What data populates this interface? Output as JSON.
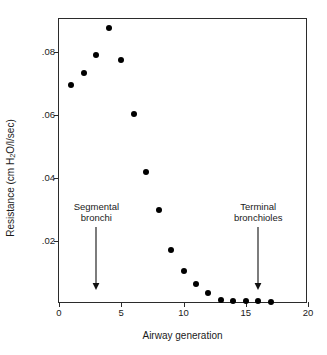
{
  "chart_data": {
    "type": "scatter",
    "title": "",
    "xlabel": "Airway generation",
    "ylabel": "Resistance (cm H2O/l/sec)",
    "ylabel_parts": {
      "before": "Resistance (cm H",
      "sub": "2",
      "after": "O/l/sec)"
    },
    "xlim": [
      0,
      20
    ],
    "ylim": [
      0,
      0.0905
    ],
    "grid": false,
    "legend": null,
    "xticks": [
      0,
      5,
      10,
      15,
      20
    ],
    "xtick_labels": [
      "0",
      "5",
      "10",
      "15",
      "20"
    ],
    "yticks": [
      0.02,
      0.04,
      0.06,
      0.08
    ],
    "ytick_labels": [
      ".02",
      ".04",
      ".06",
      ".08"
    ],
    "marker": "filled-circle",
    "marker_color": "#000000",
    "x": [
      1,
      2,
      3,
      4,
      5,
      6,
      7,
      8,
      9,
      10,
      11,
      12,
      13,
      14,
      15,
      16,
      17
    ],
    "values": [
      0.0695,
      0.0733,
      0.079,
      0.0877,
      0.0775,
      0.0602,
      0.042,
      0.03,
      0.017,
      0.0106,
      0.0063,
      0.0035,
      0.0014,
      0.001,
      0.0009,
      0.0009,
      0.0005
    ],
    "annotations": [
      {
        "id": "segmental-bronchi",
        "line1": "Segmental",
        "line2": "bronchi",
        "x": 3,
        "arrow_from_y": 0.0245,
        "arrow_to_y": 0.0045
      },
      {
        "id": "terminal-bronchioles",
        "line1": "Terminal",
        "line2": "bronchioles",
        "x": 16,
        "arrow_from_y": 0.0245,
        "arrow_to_y": 0.0045
      }
    ]
  },
  "colors": {
    "axis": "#2b2b2b",
    "marker": "#000000",
    "text": "#1a1a1a",
    "background": "#ffffff"
  }
}
